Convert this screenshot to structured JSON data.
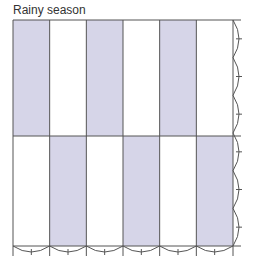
{
  "title": "Rainy season",
  "colors": {
    "shade": "#d6d5e8",
    "line": "#555555"
  },
  "grid": {
    "columns": 6,
    "rows": 2,
    "shaded_top": [
      0,
      2,
      4
    ],
    "shaded_bottom": [
      1,
      3,
      5
    ]
  }
}
